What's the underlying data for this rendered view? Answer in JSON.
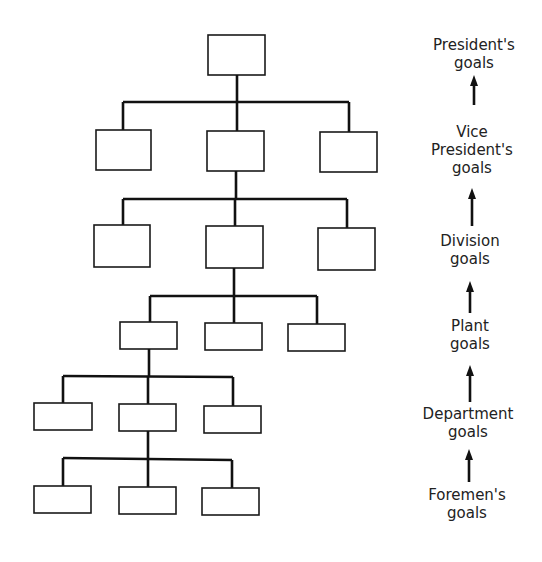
{
  "diagram": {
    "type": "organizational-hierarchy-tree",
    "levels": 6,
    "boxes_per_level": [
      1,
      3,
      3,
      3,
      3,
      3
    ],
    "goal_hierarchy": [
      {
        "label_line1": "President's",
        "label_line2": "goals"
      },
      {
        "label_line1": "Vice",
        "label_line2": "President's",
        "label_line3": "goals"
      },
      {
        "label_line1": "Division",
        "label_line2": "goals"
      },
      {
        "label_line1": "Plant",
        "label_line2": "goals"
      },
      {
        "label_line1": "Department",
        "label_line2": "goals"
      },
      {
        "label_line1": "Foremen's",
        "label_line2": "goals"
      }
    ],
    "arrow_direction": "upward",
    "colors": {
      "line": "#111111",
      "box_fill": "#ffffff",
      "text": "#222222"
    }
  }
}
